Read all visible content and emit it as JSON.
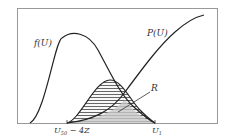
{
  "diagram": {
    "labels": {
      "f_curve": "f(U)",
      "p_curve": "P(U)",
      "region": "R",
      "x_left": "U",
      "x_left_sub": "50",
      "x_left_suffix": " − 4Z",
      "x_right": "U",
      "x_right_sub": "1"
    },
    "colors": {
      "frame": "#888888",
      "curve": "#222222",
      "hatch": "#555555",
      "fill": "#bbbbbb"
    }
  }
}
